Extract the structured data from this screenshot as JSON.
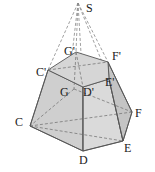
{
  "diagram": {
    "apex": {
      "label": "S"
    },
    "base_vertices": [
      {
        "label": "C"
      },
      {
        "label": "D"
      },
      {
        "label": "E"
      },
      {
        "label": "F"
      },
      {
        "label": "G"
      }
    ],
    "top_vertices": [
      {
        "label": "C'"
      },
      {
        "label": "D'"
      },
      {
        "label": "E'"
      },
      {
        "label": "F'"
      },
      {
        "label": "G'"
      }
    ],
    "colors": {
      "face_fill": "#c8c8c8",
      "top_fill": "#d8d8d8",
      "edge": "#555555",
      "hidden_edge": "#777777"
    }
  }
}
